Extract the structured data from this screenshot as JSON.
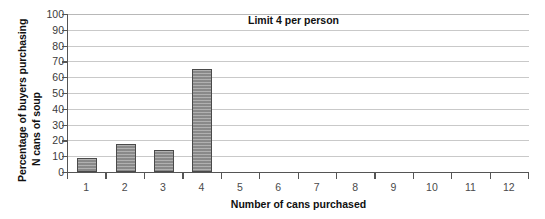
{
  "chart_data": {
    "type": "bar",
    "title": "",
    "xlabel": "Number of cans purchased",
    "ylabel_lines": [
      "Percentage of buyers purchasing",
      "N cans of soup"
    ],
    "categories": [
      "1",
      "2",
      "3",
      "4",
      "5",
      "6",
      "7",
      "8",
      "9",
      "10",
      "11",
      "12"
    ],
    "values": [
      9,
      18,
      14,
      65,
      0,
      0,
      0,
      0,
      0,
      0,
      0,
      0
    ],
    "ylim": [
      0,
      100
    ],
    "ytick_labels": [
      "0",
      "10",
      "20",
      "30",
      "40",
      "50",
      "60",
      "70",
      "80",
      "90",
      "100"
    ],
    "ytick_values": [
      0,
      10,
      20,
      30,
      40,
      50,
      60,
      70,
      80,
      90,
      100
    ],
    "grid": true,
    "grid_axis": "y",
    "legend": "none",
    "annotations": [
      {
        "text": "Limit 4 per person",
        "x": 6,
        "y": 97
      }
    ],
    "bar_color": "#8f8f8f",
    "bar_edge_color": "#4a4a4a",
    "grid_color": "#c9c9c9",
    "axis_color": "#555555",
    "background": "#ffffff"
  }
}
